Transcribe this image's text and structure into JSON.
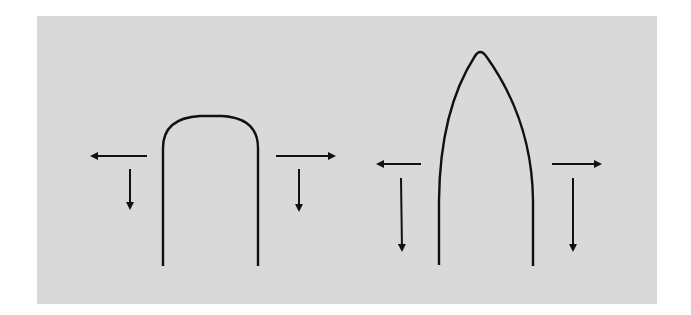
{
  "figure": {
    "background_color": "#d9d9d9",
    "stroke_color": "#111111",
    "shapes": [
      {
        "name": "rounded-arch",
        "description": "Blunt, rounded-top U-shaped profile"
      },
      {
        "name": "pointed-arch",
        "description": "Pointed, ogive-shaped profile"
      }
    ],
    "arrows": {
      "left_shape": [
        "outward-left",
        "down-left",
        "outward-right",
        "down-right"
      ],
      "right_shape": [
        "outward-left",
        "down-left (longer)",
        "outward-right",
        "down-right (longer)"
      ]
    }
  }
}
